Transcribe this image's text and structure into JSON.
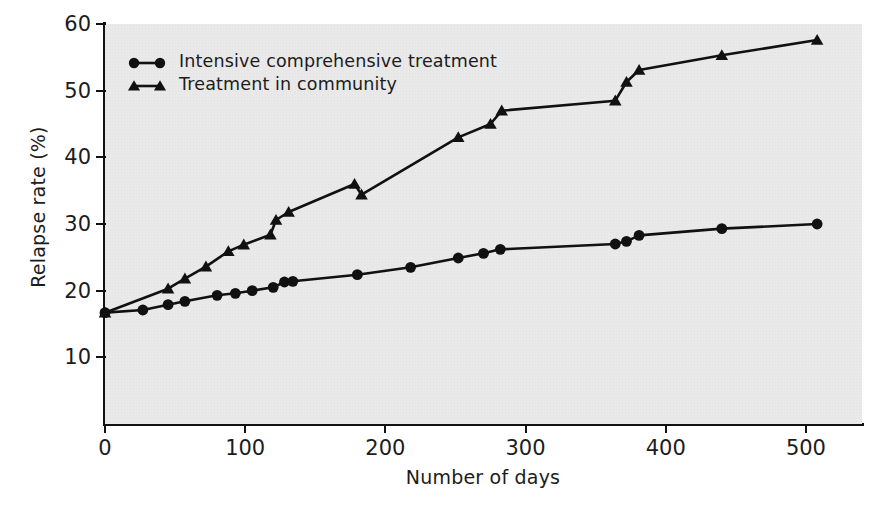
{
  "chart_data": {
    "type": "line",
    "title": "",
    "xlabel": "Number of days",
    "ylabel": "Relapse rate (%)",
    "xlim": [
      0,
      540
    ],
    "ylim": [
      0,
      60
    ],
    "xticks": [
      0,
      100,
      200,
      300,
      400,
      500
    ],
    "yticks": [
      10,
      20,
      30,
      40,
      50,
      60
    ],
    "grid": false,
    "legend_position": "top-left",
    "plot_background": "#e9e9e9",
    "line_color": "#111111",
    "series": [
      {
        "name": "Intensive comprehensive treatment",
        "marker": "circle",
        "points": [
          {
            "x": 0,
            "y": 16.7
          },
          {
            "x": 27,
            "y": 17.1
          },
          {
            "x": 45,
            "y": 17.9
          },
          {
            "x": 57,
            "y": 18.4
          },
          {
            "x": 80,
            "y": 19.3
          },
          {
            "x": 93,
            "y": 19.6
          },
          {
            "x": 105,
            "y": 20.0
          },
          {
            "x": 120,
            "y": 20.5
          },
          {
            "x": 128,
            "y": 21.3
          },
          {
            "x": 134,
            "y": 21.4
          },
          {
            "x": 180,
            "y": 22.4
          },
          {
            "x": 218,
            "y": 23.5
          },
          {
            "x": 252,
            "y": 24.9
          },
          {
            "x": 270,
            "y": 25.6
          },
          {
            "x": 282,
            "y": 26.2
          },
          {
            "x": 364,
            "y": 27.0
          },
          {
            "x": 372,
            "y": 27.4
          },
          {
            "x": 381,
            "y": 28.3
          },
          {
            "x": 440,
            "y": 29.3
          },
          {
            "x": 508,
            "y": 30.0
          }
        ]
      },
      {
        "name": "Treatment in community",
        "marker": "triangle",
        "points": [
          {
            "x": 0,
            "y": 16.7
          },
          {
            "x": 45,
            "y": 20.3
          },
          {
            "x": 57,
            "y": 21.8
          },
          {
            "x": 72,
            "y": 23.6
          },
          {
            "x": 88,
            "y": 25.9
          },
          {
            "x": 99,
            "y": 26.9
          },
          {
            "x": 118,
            "y": 28.4
          },
          {
            "x": 122,
            "y": 30.6
          },
          {
            "x": 131,
            "y": 31.8
          },
          {
            "x": 178,
            "y": 36.0
          },
          {
            "x": 183,
            "y": 34.4
          },
          {
            "x": 252,
            "y": 43.0
          },
          {
            "x": 275,
            "y": 45.0
          },
          {
            "x": 283,
            "y": 47.0
          },
          {
            "x": 364,
            "y": 48.5
          },
          {
            "x": 372,
            "y": 51.3
          },
          {
            "x": 381,
            "y": 53.1
          },
          {
            "x": 440,
            "y": 55.3
          },
          {
            "x": 508,
            "y": 57.6
          }
        ]
      }
    ]
  },
  "legend": {
    "items": [
      {
        "label": "Intensive comprehensive treatment",
        "marker": "circle"
      },
      {
        "label": "Treatment in community",
        "marker": "triangle"
      }
    ]
  },
  "axes": {
    "x_title": "Number of days",
    "y_title": "Relapse rate (%)",
    "x_tick_labels": [
      "0",
      "100",
      "200",
      "300",
      "400",
      "500"
    ],
    "y_tick_labels": [
      "10",
      "20",
      "30",
      "40",
      "50",
      "60"
    ]
  }
}
